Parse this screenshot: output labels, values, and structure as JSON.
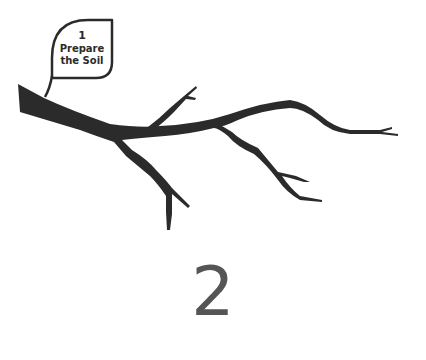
{
  "leaf": {
    "number": "1",
    "line1": "Prepare",
    "line2": "the Soil"
  },
  "step": {
    "number": "2"
  },
  "colors": {
    "branch": "#2b2b2b",
    "leaf_outline": "#2b2b2b",
    "step_number": "#555555"
  }
}
